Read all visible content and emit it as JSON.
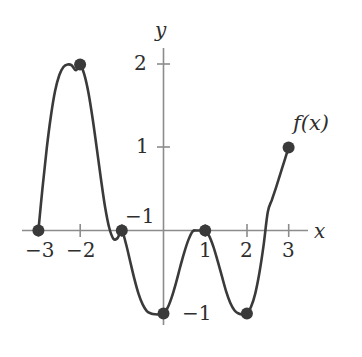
{
  "figure": {
    "kind": "function-graph",
    "width": 362,
    "height": 357,
    "background_color": "#ffffff",
    "curve_color": "#3a3a3a",
    "axis_color": "#8c8c8c",
    "point_color": "#3a3a3a",
    "text_color": "#2e2e2e"
  },
  "axes": {
    "x_axis_label": "x",
    "y_axis_label": "y",
    "x_ticks": [
      {
        "value": -3,
        "label": "−3"
      },
      {
        "value": -2,
        "label": "−2"
      },
      {
        "value": 1,
        "label": "1"
      },
      {
        "value": 2,
        "label": "2"
      },
      {
        "value": 3,
        "label": "3"
      }
    ],
    "y_ticks": [
      {
        "value": 2,
        "label": "2"
      },
      {
        "value": 1,
        "label": "1"
      },
      {
        "value": -1,
        "label": "−1"
      }
    ],
    "stray_label": "−1"
  },
  "curve": {
    "label": "f(x)",
    "label_parts": {
      "f": "f",
      "open": "(",
      "var": "x",
      "close": ")"
    }
  },
  "chart_data": {
    "type": "line",
    "title": "",
    "subtitle": "",
    "xlabel": "x",
    "ylabel": "y",
    "xlim": [
      -3.25,
      3.25
    ],
    "ylim": [
      -1.45,
      2.35
    ],
    "grid": false,
    "legend": "none",
    "annotations": [
      {
        "text": "f(x)",
        "x": 3.15,
        "y": 1.45
      },
      {
        "text": "−1",
        "x": -0.35,
        "y": 0.2
      },
      {
        "text": "−1",
        "x": 0.55,
        "y": -1.0
      }
    ],
    "series": [
      {
        "name": "f(x)",
        "marked_points": [
          {
            "x": -3,
            "y": 0,
            "role": "endpoint-root"
          },
          {
            "x": -2,
            "y": 2,
            "role": "local-maximum"
          },
          {
            "x": -1,
            "y": 0,
            "role": "root"
          },
          {
            "x": 0,
            "y": -1,
            "role": "local-minimum"
          },
          {
            "x": 1,
            "y": 0,
            "role": "local-maximum-on-axis"
          },
          {
            "x": 2,
            "y": -1,
            "role": "local-minimum"
          },
          {
            "x": 3,
            "y": 1,
            "role": "endpoint"
          }
        ],
        "x": [
          -3.0,
          -2.9,
          -2.8,
          -2.7,
          -2.6,
          -2.5,
          -2.4,
          -2.3,
          -2.2,
          -2.1,
          -2.0,
          -1.9,
          -1.8,
          -1.7,
          -1.6,
          -1.5,
          -1.4,
          -1.3,
          -1.2,
          -1.1,
          -1.0,
          -0.9,
          -0.8,
          -0.7,
          -0.6,
          -0.5,
          -0.4,
          -0.3,
          -0.2,
          -0.1,
          0.0,
          0.1,
          0.2,
          0.3,
          0.4,
          0.5,
          0.6,
          0.7,
          0.8,
          0.9,
          1.0,
          1.1,
          1.2,
          1.3,
          1.4,
          1.5,
          1.6,
          1.7,
          1.8,
          1.9,
          2.0,
          2.1,
          2.2,
          2.3,
          2.4,
          2.5,
          2.6,
          2.7,
          2.8,
          2.9,
          3.0
        ],
        "y": [
          0.0,
          0.52,
          0.99,
          1.38,
          1.68,
          1.87,
          1.97,
          2.0,
          1.99,
          1.93,
          2.0,
          1.88,
          1.66,
          1.35,
          0.99,
          0.62,
          0.28,
          0.03,
          -0.1,
          -0.09,
          0.0,
          -0.16,
          -0.37,
          -0.58,
          -0.76,
          -0.89,
          -0.97,
          -1.0,
          -1.01,
          -1.01,
          -1.0,
          -0.93,
          -0.8,
          -0.63,
          -0.44,
          -0.26,
          -0.11,
          -0.01,
          0.0,
          0.0,
          0.0,
          -0.07,
          -0.2,
          -0.37,
          -0.55,
          -0.73,
          -0.87,
          -0.96,
          -1.0,
          -1.01,
          -1.0,
          -0.92,
          -0.76,
          -0.51,
          -0.18,
          0.22,
          0.37,
          0.52,
          0.68,
          0.84,
          1.0
        ]
      }
    ]
  }
}
